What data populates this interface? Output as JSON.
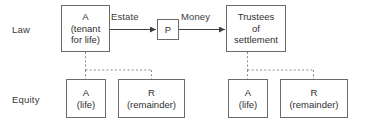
{
  "diagram": {
    "row_labels": {
      "law": "Law",
      "equity": "Equity"
    },
    "nodes": {
      "a_tenant": {
        "line1": "A",
        "line2": "(tenant",
        "line3": "for life)"
      },
      "p": {
        "line1": "P"
      },
      "trustees": {
        "line1": "Trustees",
        "line2": "of",
        "line3": "settlement"
      },
      "a_life_left": {
        "line1": "A",
        "line2": "(life)"
      },
      "r_remainder_left": {
        "line1": "R",
        "line2": "(remainder)"
      },
      "a_life_right": {
        "line1": "A",
        "line2": "(life)"
      },
      "r_remainder_right": {
        "line1": "R",
        "line2": "(remainder)"
      }
    },
    "edges": {
      "estate": "Estate",
      "money": "Money"
    },
    "colors": {
      "box_border": "#6a6a6a",
      "text": "#2f2f2f",
      "solid_line": "#3f3f3f",
      "dashed_line": "#8a8a8a",
      "background": "#ffffff"
    }
  }
}
